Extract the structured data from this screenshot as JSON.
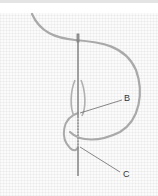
{
  "diagram": {
    "labels": {
      "b": "B",
      "c": "C"
    },
    "colors": {
      "thread": "#a9a9a9",
      "needle": "#8a8a8a",
      "leader_line": "#555555",
      "label_text": "#333333",
      "fabric": "#fbfbfb",
      "top_band": "#e4e4e4"
    }
  }
}
